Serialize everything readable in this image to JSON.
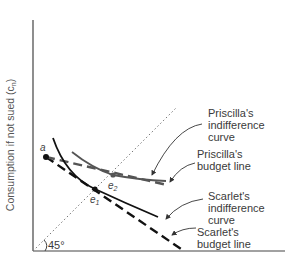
{
  "diagram": {
    "y_axis_label": "Consumption if not sued (c",
    "y_axis_subscript": "n",
    "y_axis_label_close": ")",
    "angle_label": "45°",
    "points": {
      "a": {
        "label": "a"
      },
      "e1": {
        "label": "e",
        "sub": "1"
      },
      "e2": {
        "label": "e",
        "sub": "2"
      }
    },
    "callouts": {
      "priscilla_indifference": [
        "Priscilla's",
        "indifference",
        "curve"
      ],
      "priscilla_budget": [
        "Priscilla's",
        "budget line"
      ],
      "scarlet_indifference": [
        "Scarlet's",
        "indifference",
        "curve"
      ],
      "scarlet_budget": [
        "Scarlet's",
        "budget line"
      ]
    },
    "colors": {
      "scarlet": "#111111",
      "priscilla": "#555555",
      "axis": "#444444",
      "diagonal": "#777777"
    }
  }
}
